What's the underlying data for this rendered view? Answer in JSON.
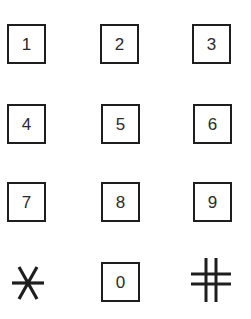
{
  "keypad": {
    "rows": [
      [
        {
          "label": "1",
          "x": 7,
          "y": 24
        },
        {
          "label": "2",
          "x": 100,
          "y": 24
        },
        {
          "label": "3",
          "x": 192,
          "y": 24
        }
      ],
      [
        {
          "label": "4",
          "x": 7,
          "y": 104
        },
        {
          "label": "5",
          "x": 101,
          "y": 104
        },
        {
          "label": "6",
          "x": 193,
          "y": 104
        }
      ],
      [
        {
          "label": "7",
          "x": 7,
          "y": 182
        },
        {
          "label": "8",
          "x": 101,
          "y": 182
        },
        {
          "label": "9",
          "x": 193,
          "y": 182
        }
      ]
    ],
    "bottom_row": {
      "star": {
        "symbol": "asterisk",
        "icon": "star-icon"
      },
      "zero": {
        "label": "0",
        "x": 101,
        "y": 262
      },
      "hash": {
        "symbol": "hash",
        "icon": "hash-icon"
      }
    },
    "colors": {
      "ink": "#1e1e1e",
      "background": "#ffffff"
    }
  }
}
